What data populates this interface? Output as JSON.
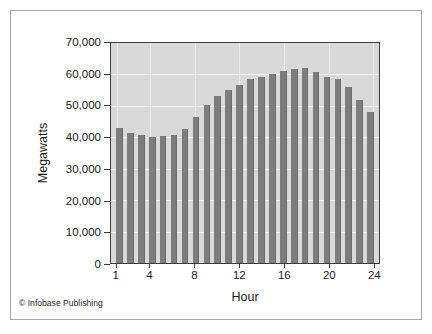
{
  "figure": {
    "credit": "© Infobase Publishing",
    "frame_color": "#a6a6a6",
    "background": "#ffffff"
  },
  "chart_data": {
    "type": "bar",
    "title": "",
    "subtitle": "",
    "xlabel": "Hour",
    "ylabel": "Megawatts",
    "categories": [
      1,
      2,
      3,
      4,
      5,
      6,
      7,
      8,
      9,
      10,
      11,
      12,
      13,
      14,
      15,
      16,
      17,
      18,
      19,
      20,
      21,
      22,
      23,
      24
    ],
    "values": [
      43000,
      41300,
      40700,
      40000,
      40400,
      40800,
      42800,
      46500,
      50400,
      53100,
      55100,
      56500,
      58400,
      59300,
      60300,
      61200,
      61700,
      61900,
      60800,
      59100,
      58600,
      56000,
      52000,
      48000
    ],
    "ylim": [
      0,
      70000
    ],
    "ytick_values": [
      0,
      10000,
      20000,
      30000,
      40000,
      50000,
      60000,
      70000
    ],
    "ytick_labels": [
      "0",
      "10,000",
      "20,000",
      "30,000",
      "40,000",
      "50,000",
      "60,000",
      "70,000"
    ],
    "xtick_values": [
      1,
      4,
      8,
      12,
      16,
      20,
      24
    ],
    "xtick_labels": [
      "1",
      "4",
      "8",
      "12",
      "16",
      "20",
      "24"
    ],
    "grid": true,
    "legend": null,
    "legend_position": "none",
    "bar_color": "#7d7d7d",
    "plot_background": "#d9d9d9",
    "gridline_color": "#f2f2f2"
  }
}
